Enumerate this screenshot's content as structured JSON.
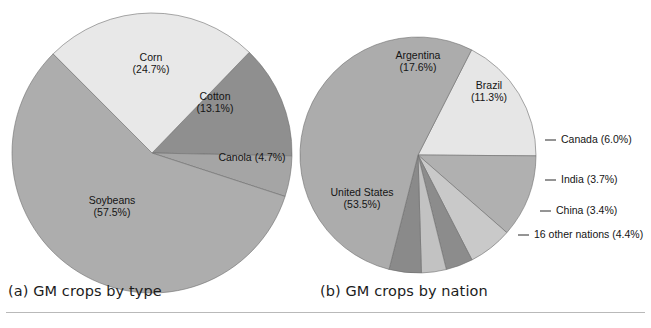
{
  "figure": {
    "background": "#ffffff",
    "rule_color": "#b9b9b9"
  },
  "captions": {
    "a": "(a) GM crops by type",
    "b": "(b) GM crops by nation"
  },
  "chart_data": [
    {
      "type": "pie",
      "id": "gm-crops-by-type",
      "title": "(a) GM crops by type",
      "center": [
        152,
        153
      ],
      "radius": 140,
      "start_angle_deg": -46,
      "direction": "clockwise",
      "labels_inside": true,
      "categories": [
        "Cotton",
        "Canola",
        "Soybeans",
        "Corn"
      ],
      "values": [
        13.1,
        4.7,
        57.5,
        24.7
      ],
      "colors": [
        "#8f8f8f",
        "#a5a5a5",
        "#adadad",
        "#e8e8e8"
      ],
      "slices": [
        {
          "name": "Cotton",
          "value": 13.1,
          "label": "Cotton",
          "value_label": "(13.1%)",
          "color": "#8f8f8f",
          "label_x": 215,
          "label_y": 103,
          "two_line": true
        },
        {
          "name": "Canola",
          "value": 4.7,
          "label": "Canola (4.7%)",
          "value_label": "",
          "color": "#a5a5a5",
          "label_x": 252,
          "label_y": 158,
          "two_line": false
        },
        {
          "name": "Soybeans",
          "value": 57.5,
          "label": "Soybeans",
          "value_label": "(57.5%)",
          "color": "#adadad",
          "label_x": 112,
          "label_y": 207,
          "two_line": true
        },
        {
          "name": "Corn",
          "value": 24.7,
          "label": "Corn",
          "value_label": "(24.7%)",
          "color": "#e8e8e8",
          "label_x": 151,
          "label_y": 64,
          "two_line": true
        }
      ]
    },
    {
      "type": "pie",
      "id": "gm-crops-by-nation",
      "title": "(b) GM crops by nation",
      "center": [
        418,
        155
      ],
      "radius": 118,
      "start_angle_deg": -63,
      "direction": "clockwise",
      "labels_inside": false,
      "categories": [
        "Argentina",
        "Brazil",
        "Canada",
        "India",
        "China",
        "16 other nations",
        "United States"
      ],
      "values": [
        17.6,
        11.3,
        6.0,
        3.7,
        3.4,
        4.4,
        53.5
      ],
      "colors": [
        "#e6e6e6",
        "#b0b0b0",
        "#c9c9c9",
        "#8c8c8c",
        "#c2c2c2",
        "#8a8a8a",
        "#acacac"
      ],
      "slices": [
        {
          "name": "Argentina",
          "value": 17.6,
          "label": "Argentina",
          "value_label": "(17.6%)",
          "color": "#e6e6e6",
          "placement": "inside",
          "label_x": 418,
          "label_y": 62,
          "two_line": true
        },
        {
          "name": "Brazil",
          "value": 11.3,
          "label": "Brazil",
          "value_label": "(11.3%)",
          "color": "#b0b0b0",
          "placement": "inside",
          "label_x": 489,
          "label_y": 92,
          "two_line": true
        },
        {
          "name": "Canada",
          "value": 6.0,
          "label": "Canada (6.0%)",
          "value_label": "",
          "color": "#c9c9c9",
          "placement": "leader",
          "leader_x1": 545,
          "leader_x2": 556,
          "leader_y": 140,
          "label_x": 561,
          "label_y": 140
        },
        {
          "name": "India",
          "value": 3.7,
          "label": "India (3.7%)",
          "value_label": "",
          "color": "#8c8c8c",
          "placement": "leader",
          "leader_x1": 545,
          "leader_x2": 556,
          "leader_y": 180,
          "label_x": 561,
          "label_y": 180
        },
        {
          "name": "China",
          "value": 3.4,
          "label": "China (3.4%)",
          "value_label": "",
          "color": "#c2c2c2",
          "placement": "leader",
          "leader_x1": 540,
          "leader_x2": 551,
          "leader_y": 211,
          "label_x": 556,
          "label_y": 211
        },
        {
          "name": "16 other nations",
          "value": 4.4,
          "label": "16 other nations (4.4%)",
          "value_label": "",
          "color": "#8a8a8a",
          "placement": "leader",
          "leader_x1": 518,
          "leader_x2": 529,
          "leader_y": 235,
          "label_x": 534,
          "label_y": 235
        },
        {
          "name": "United States",
          "value": 53.5,
          "label": "United States",
          "value_label": "(53.5%)",
          "color": "#acacac",
          "placement": "inside",
          "label_x": 362,
          "label_y": 199,
          "two_line": true
        }
      ]
    }
  ]
}
